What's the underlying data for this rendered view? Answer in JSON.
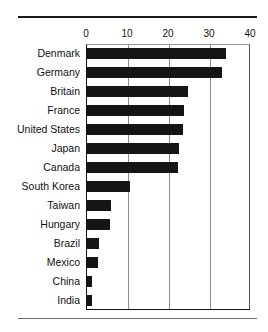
{
  "chart_data": {
    "type": "bar",
    "orientation": "horizontal",
    "title": "",
    "subtitle": "",
    "xlabel": "",
    "ylabel": "",
    "categories": [
      "Denmark",
      "Germany",
      "Britain",
      "France",
      "United States",
      "Japan",
      "Canada",
      "South Korea",
      "Taiwan",
      "Hungary",
      "Brazil",
      "Mexico",
      "China",
      "India"
    ],
    "values": [
      33.8,
      33.0,
      24.6,
      23.7,
      23.4,
      22.4,
      22.2,
      10.5,
      5.9,
      5.7,
      2.9,
      2.7,
      1.2,
      1.2
    ],
    "series": [
      {
        "name": "value",
        "values": [
          33.8,
          33.0,
          24.6,
          23.7,
          23.4,
          22.4,
          22.2,
          10.5,
          5.9,
          5.7,
          2.9,
          2.7,
          1.2,
          1.2
        ]
      }
    ],
    "xlim": [
      0,
      40
    ],
    "xticks": [
      0,
      10,
      20,
      30,
      40
    ],
    "xtick_labels": [
      "0",
      "10",
      "20",
      "30",
      "40"
    ],
    "grid": "vertical",
    "legend": "none",
    "bar_color": "#151515",
    "axis_color": "#111111",
    "gridline_color": "#8c8c8c",
    "background": "#ffffff",
    "annotations": []
  },
  "figure": {
    "rule_top": "",
    "rule_bottom": ""
  }
}
